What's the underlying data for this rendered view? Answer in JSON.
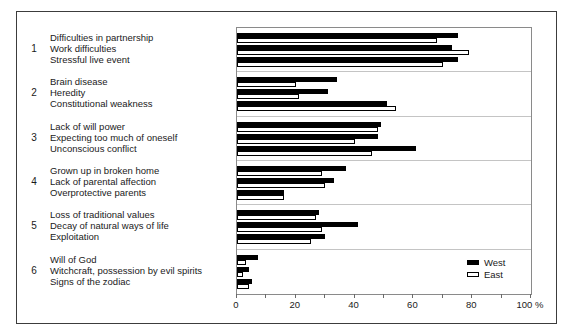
{
  "legend": {
    "west_label": "West",
    "east_label": "East"
  },
  "axis": {
    "tick_labels": [
      "0",
      "20",
      "40",
      "60",
      "80",
      "100 %"
    ],
    "minor_step": 10,
    "max": 100
  },
  "chart_data": {
    "type": "bar",
    "orientation": "horizontal",
    "x_unit": "%",
    "xlim": [
      0,
      100
    ],
    "grid": false,
    "legend_position": "inside-bottom-right",
    "series_names": [
      "West",
      "East"
    ],
    "groups": [
      {
        "number": "1",
        "items": [
          {
            "label": "Difficulties in partnership",
            "west": 75,
            "east": 68
          },
          {
            "label": "Work difficulties",
            "west": 73,
            "east": 79
          },
          {
            "label": "Stressful live event",
            "west": 75,
            "east": 70
          }
        ]
      },
      {
        "number": "2",
        "items": [
          {
            "label": "Brain disease",
            "west": 34,
            "east": 20
          },
          {
            "label": "Heredity",
            "west": 31,
            "east": 21
          },
          {
            "label": "Constitutional weakness",
            "west": 51,
            "east": 54
          }
        ]
      },
      {
        "number": "3",
        "items": [
          {
            "label": "Lack of will power",
            "west": 49,
            "east": 48
          },
          {
            "label": "Expecting too much of oneself",
            "west": 48,
            "east": 40
          },
          {
            "label": "Unconscious conflict",
            "west": 61,
            "east": 46
          }
        ]
      },
      {
        "number": "4",
        "items": [
          {
            "label": "Grown up in broken home",
            "west": 37,
            "east": 29
          },
          {
            "label": "Lack of parental affection",
            "west": 33,
            "east": 30
          },
          {
            "label": "Overprotective parents",
            "west": 16,
            "east": 16
          }
        ]
      },
      {
        "number": "5",
        "items": [
          {
            "label": "Loss of traditional values",
            "west": 28,
            "east": 27
          },
          {
            "label": "Decay of natural ways of life",
            "west": 41,
            "east": 29
          },
          {
            "label": "Exploitation",
            "west": 30,
            "east": 25
          }
        ]
      },
      {
        "number": "6",
        "items": [
          {
            "label": "Will of God",
            "west": 7,
            "east": 3
          },
          {
            "label": "Witchcraft, possession by evil spirits",
            "west": 4,
            "east": 2
          },
          {
            "label": "Signs of the zodiac",
            "west": 5,
            "east": 4
          }
        ]
      }
    ]
  }
}
